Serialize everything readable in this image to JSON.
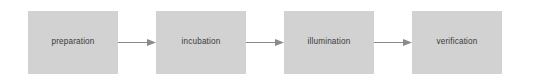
{
  "diagram": {
    "type": "linear-process-flow",
    "orientation": "horizontal",
    "background_color": "#ffffff",
    "node_fill_color": "#d2d2d2",
    "node_text_color": "#3a3a3a",
    "arrow_color": "#8a8a8a",
    "node_count": 4,
    "arrow_count": 3,
    "nodes": [
      {
        "id": "node-1",
        "label": "preparation"
      },
      {
        "id": "node-2",
        "label": "incubation"
      },
      {
        "id": "node-3",
        "label": "illumination"
      },
      {
        "id": "node-4",
        "label": "verification"
      }
    ],
    "arrows": [
      {
        "id": "arrow-1",
        "from": "preparation",
        "to": "incubation",
        "icon": "arrow-right-icon"
      },
      {
        "id": "arrow-2",
        "from": "incubation",
        "to": "illumination",
        "icon": "arrow-right-icon"
      },
      {
        "id": "arrow-3",
        "from": "illumination",
        "to": "verification",
        "icon": "arrow-right-icon"
      }
    ]
  }
}
